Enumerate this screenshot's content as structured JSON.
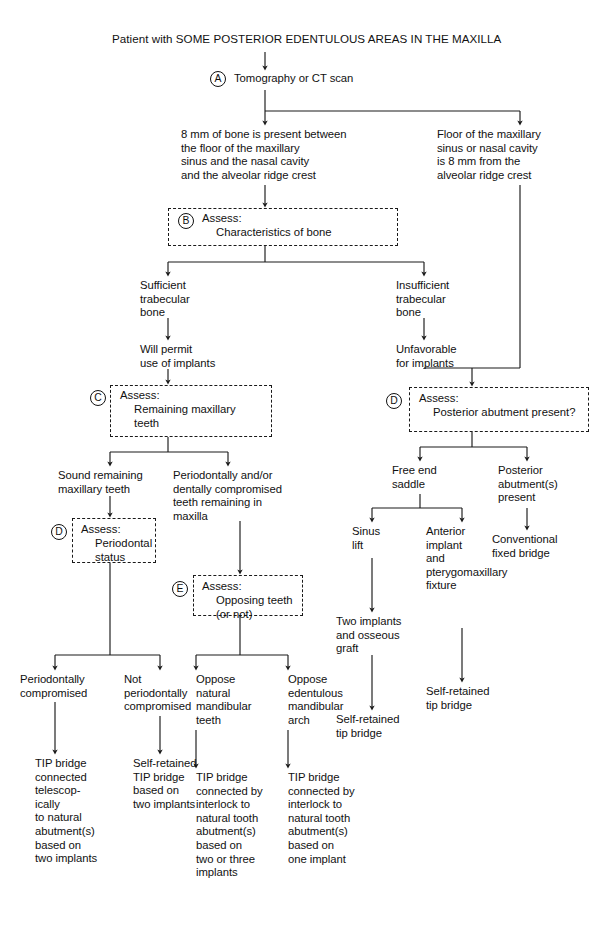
{
  "figure": {
    "title": "Patient with SOME POSTERIOR EDENTULOUS AREAS IN THE MAXILLA",
    "type": "clinical-decision-flowchart",
    "line_color": "#1a1a1a",
    "background": "#ffffff"
  },
  "nodes": {
    "root": "Patient with SOME POSTERIOR EDENTULOUS AREAS IN THE MAXILLA",
    "a_step": "Tomography or CT scan",
    "a_marker": "A",
    "bone_8mm_present": "8 mm of bone is present between\nthe floor of the maxillary\nsinus and the nasal cavity\nand the alveolar ridge crest",
    "floor_8mm_from": "Floor of the maxillary\nsinus or nasal cavity\nis 8 mm from the\nalveolar ridge crest",
    "b_marker": "B",
    "b_assess_head": "Assess:",
    "b_assess_body": "Characteristics of bone",
    "sufficient_trabecular": "Sufficient\ntrabecular\nbone",
    "insufficient_trabecular": "Insufficient\ntrabecular\nbone",
    "will_permit": "Will permit\nuse of implants",
    "unfavorable": "Unfavorable\nfor implants",
    "c_marker": "C",
    "c_assess_head": "Assess:",
    "c_assess_body": "Remaining maxillary\nteeth",
    "d_right_marker": "D",
    "d_right_assess_head": "Assess:",
    "d_right_assess_body": "Posterior abutment present?",
    "sound_remaining": "Sound remaining\nmaxillary teeth",
    "perio_compromised_teeth": "Periodontally and/or\ndentally compromised\nteeth remaining in\nmaxilla",
    "free_end_saddle": "Free end\nsaddle",
    "posterior_abutments_present": "Posterior\nabutment(s)\npresent",
    "d_left_marker": "D",
    "d_left_assess_head": "Assess:",
    "d_left_assess_body": "Periodontal\nstatus",
    "e_marker": "E",
    "e_assess_head": "Assess:",
    "e_assess_body": "Opposing teeth\n(or not)",
    "sinus_lift": "Sinus\nlift",
    "anterior_implant": "Anterior\nimplant\nand\npterygomaxillary\nfixture",
    "conventional_fixed_bridge": "Conventional\nfixed bridge",
    "two_implants_osseous": "Two implants\nand osseous\ngraft",
    "self_retained_tip_bridge_mid": "Self-retained\ntip bridge",
    "self_retained_tip_bridge_right": "Self-retained\ntip bridge",
    "perio_compromised": "Periodontally\ncompromised",
    "not_perio_compromised": "Not\nperiodontally\ncompromised",
    "oppose_natural": "Oppose\nnatural\nmandibular\nteeth",
    "oppose_edentulous": "Oppose\nedentulous\nmandibular\narch",
    "outcome_telescopic": "TIP bridge\nconnected\ntelescop-\nically\nto natural\nabutment(s)\nbased on\ntwo implants",
    "outcome_self_retained_two": "Self-retained\nTIP bridge\nbased on\ntwo implants",
    "outcome_interlock_two_three": "TIP bridge\nconnected by\ninterlock to\nnatural tooth\nabutment(s)\nbased on\ntwo or three\nimplants",
    "outcome_interlock_one": "TIP bridge\nconnected by\ninterlock to\nnatural tooth\nabutment(s)\nbased on\none implant"
  }
}
